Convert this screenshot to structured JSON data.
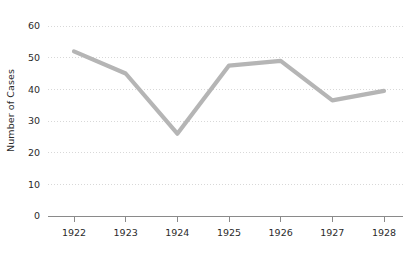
{
  "chart_data": {
    "type": "line",
    "title": "",
    "xlabel": "",
    "ylabel": "Number of Cases",
    "categories": [
      "1922",
      "1923",
      "1924",
      "1925",
      "1926",
      "1927",
      "1928"
    ],
    "values": [
      52,
      45,
      26,
      47.5,
      49,
      36.5,
      39.5
    ],
    "series": [
      {
        "name": "Number of Cases",
        "values": [
          52,
          45,
          26,
          47.5,
          49,
          36.5,
          39.5
        ]
      }
    ],
    "ylim": [
      0,
      60
    ],
    "xlim": [
      "1922",
      "1928"
    ],
    "y_ticks": [
      "0",
      "10",
      "20",
      "30",
      "40",
      "50",
      "60"
    ],
    "y_tick_values": [
      0,
      10,
      20,
      30,
      40,
      50,
      60
    ],
    "x_ticks": [
      "1922",
      "1923",
      "1924",
      "1925",
      "1926",
      "1927",
      "1928"
    ],
    "grid": true,
    "grid_axis": "y",
    "grid_style": "dotted",
    "legend": false,
    "legend_position": "none",
    "line_color": "#b5b5b5",
    "axis_color": "#8a8a8a",
    "grid_color": "#d8d8d8",
    "text_color": "#2b2b2b",
    "background_color": "#ffffff"
  }
}
